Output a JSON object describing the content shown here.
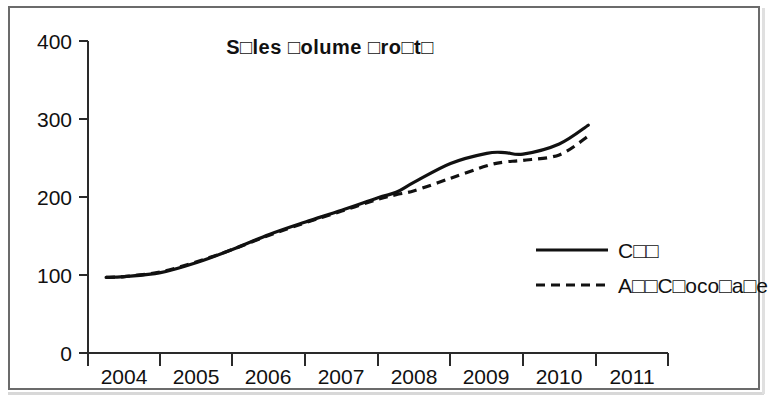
{
  "chart_data": {
    "type": "line",
    "title": "S□les □olume □ro□t□",
    "xlabel": "",
    "ylabel": "",
    "grid": false,
    "legend_position": "right-inside",
    "xlim": [
      2003.5,
      2011.5
    ],
    "ylim": [
      0,
      400
    ],
    "y_ticks": [
      0,
      100,
      200,
      300,
      400
    ],
    "y_tick_labels": [
      "0",
      "100",
      "200",
      "300",
      "400"
    ],
    "x_tick_labels": [
      "2004",
      "2005",
      "2006",
      "2007",
      "2008",
      "2009",
      "2010",
      "2011"
    ],
    "x": [
      2003.75,
      2004.0,
      2004.5,
      2005.0,
      2005.5,
      2006.0,
      2006.5,
      2007.0,
      2007.5,
      2007.75,
      2008.0,
      2008.5,
      2009.0,
      2009.25,
      2009.5,
      2010.0,
      2010.4
    ],
    "series": [
      {
        "name": "C□□",
        "style": "solid",
        "values": [
          97,
          98,
          103,
          116,
          133,
          152,
          168,
          183,
          199,
          206,
          219,
          243,
          256,
          257,
          255,
          268,
          292
        ]
      },
      {
        "name": "A□□C□oco□a□e",
        "style": "dashed",
        "values": [
          97,
          98,
          104,
          117,
          133,
          151,
          167,
          182,
          197,
          203,
          208,
          224,
          240,
          245,
          247,
          254,
          278
        ]
      }
    ]
  },
  "legend": {
    "entries": [
      {
        "label": "C□□",
        "style": "solid"
      },
      {
        "label": "A□□C□oco□a□e",
        "style": "dashed"
      }
    ]
  },
  "axes": {
    "y_labels": [
      "400",
      "300",
      "200",
      "100",
      "0"
    ],
    "x_labels": [
      "2004",
      "2005",
      "2006",
      "2007",
      "2008",
      "2009",
      "2010",
      "2011"
    ]
  }
}
